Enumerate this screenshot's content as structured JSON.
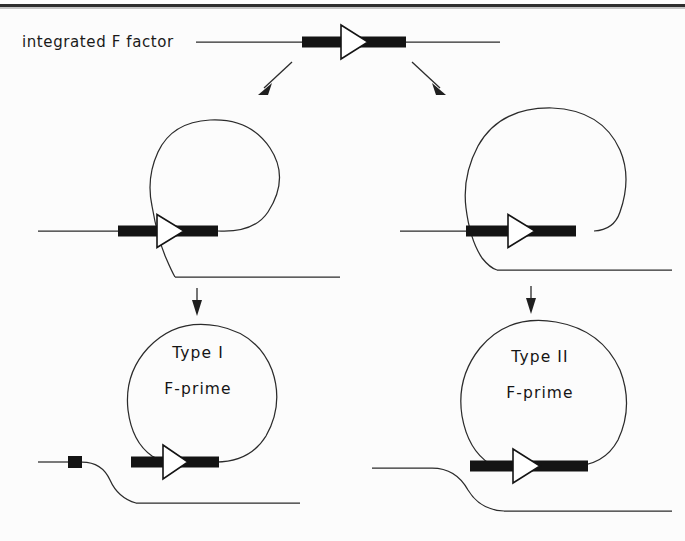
{
  "figure": {
    "title_label": "integrated F factor",
    "domain": "molecular-genetics-diagram",
    "caption_absent": true,
    "background_color": "#fefefe",
    "ink_color": "#1f1f1f",
    "accent_fill": "#141414",
    "page_rule_color": "#2e2e2e"
  },
  "stages": {
    "top": {
      "name": "integrated-f-factor",
      "label": "integrated F factor",
      "f_factor": {
        "bar_fill": "#141414",
        "triangle_fill": "#ffffff",
        "orientation": "right"
      }
    },
    "left_branch": {
      "name": "type-i-pathway",
      "excision_label": "",
      "product_title": "Type I",
      "product_subtitle": "F-prime",
      "has_host_marker_square": true,
      "loop_shape": "teardrop"
    },
    "right_branch": {
      "name": "type-ii-pathway",
      "excision_label": "",
      "product_title": "Type II",
      "product_subtitle": "F-prime",
      "has_host_marker_square": false,
      "loop_shape": "round"
    }
  },
  "labels": {
    "integrated_f_factor": "integrated F factor",
    "type_i": "Type I",
    "type_ii": "Type II",
    "f_prime": "F-prime"
  },
  "arrows": {
    "branch_left": {
      "name": "arrow-to-left-excision",
      "direction": "down-left"
    },
    "branch_right": {
      "name": "arrow-to-right-excision",
      "direction": "down-right"
    },
    "left_down": {
      "name": "arrow-to-type-i",
      "direction": "down"
    },
    "right_down": {
      "name": "arrow-to-type-ii",
      "direction": "down"
    }
  }
}
